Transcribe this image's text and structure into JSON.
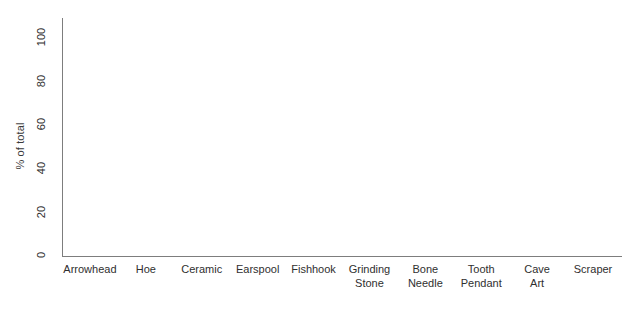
{
  "chart_data": {
    "type": "bar",
    "title": "",
    "subtitle": "",
    "xlabel": "",
    "ylabel": "% of total",
    "ylim": [
      0,
      100
    ],
    "ytick_labels": [
      "100",
      "80",
      "60",
      "40",
      "20",
      "0"
    ],
    "yticks": [
      100,
      80,
      60,
      40,
      20,
      0
    ],
    "grid": false,
    "legend": null,
    "categories": [
      "Arrowhead",
      "Hoe",
      "Ceramic",
      "Earspool",
      "Fishhook",
      "Grinding\nStone",
      "Bone\nNeedle",
      "Tooth\nPendant",
      "Cave\nArt",
      "Scraper"
    ],
    "values": [
      0,
      0,
      0,
      0,
      0,
      0,
      0,
      0,
      0,
      0
    ]
  },
  "axis": {
    "y_title": "% of total"
  }
}
